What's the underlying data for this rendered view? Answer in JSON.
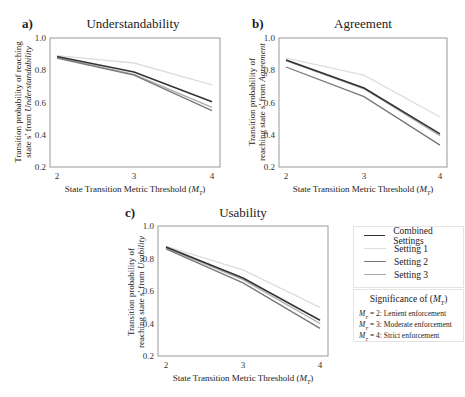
{
  "chart_data": [
    {
      "panel": "a)",
      "type": "line",
      "title": "Understandability",
      "xlabel": "State Transition Metric Threshold (M_T)",
      "ylabel_line1": "Transition probability of reaching",
      "ylabel_line2_prefix": "state s' from ",
      "ylabel_line2_italic": "Understandability",
      "x": [
        2,
        3,
        4
      ],
      "xticks": [
        "2",
        "3",
        "4"
      ],
      "yticks": [
        "1.0",
        "0.8",
        "0.6",
        "0.4",
        "0.2"
      ],
      "ylim": [
        0.2,
        1.0
      ],
      "grid": false,
      "series": [
        {
          "name": "Setting 1",
          "values": [
            0.89,
            0.845,
            0.71
          ]
        },
        {
          "name": "Setting 3",
          "values": [
            0.88,
            0.775,
            0.57
          ]
        },
        {
          "name": "Setting 2",
          "values": [
            0.875,
            0.77,
            0.55
          ]
        },
        {
          "name": "Combined Settings",
          "values": [
            0.885,
            0.79,
            0.605
          ]
        }
      ]
    },
    {
      "panel": "b)",
      "type": "line",
      "title": "Agreement",
      "xlabel": "State Transition Metric Threshold (M_T)",
      "ylabel_line1": "Transition probability of",
      "ylabel_line2_prefix": "reaching state s' from ",
      "ylabel_line2_italic": "Agreement",
      "x": [
        2,
        3,
        4
      ],
      "xticks": [
        "2",
        "3",
        "4"
      ],
      "yticks": [
        "1.0",
        "0.8",
        "0.6",
        "0.4",
        "0.2"
      ],
      "ylim": [
        0.2,
        1.0
      ],
      "grid": false,
      "series": [
        {
          "name": "Setting 1",
          "values": [
            0.875,
            0.77,
            0.51
          ]
        },
        {
          "name": "Setting 3",
          "values": [
            0.86,
            0.685,
            0.395
          ]
        },
        {
          "name": "Setting 2",
          "values": [
            0.82,
            0.636,
            0.336
          ]
        },
        {
          "name": "Combined Settings",
          "values": [
            0.864,
            0.69,
            0.405
          ]
        }
      ]
    },
    {
      "panel": "c)",
      "type": "line",
      "title": "Usability",
      "xlabel": "State Transition Metric Threshold (M_T)",
      "ylabel_line1": "Transition probability of",
      "ylabel_line2_prefix": "reaching state s' from ",
      "ylabel_line2_italic": "Usability",
      "x": [
        2,
        3,
        4
      ],
      "xticks": [
        "2",
        "3",
        "4"
      ],
      "yticks": [
        "1.0",
        "0.8",
        "0.6",
        "0.4",
        "0.2"
      ],
      "ylim": [
        0.2,
        1.0
      ],
      "grid": false,
      "series": [
        {
          "name": "Setting 1",
          "values": [
            0.875,
            0.73,
            0.5
          ]
        },
        {
          "name": "Setting 3",
          "values": [
            0.865,
            0.67,
            0.4
          ]
        },
        {
          "name": "Setting 2",
          "values": [
            0.86,
            0.65,
            0.37
          ]
        },
        {
          "name": "Combined Settings",
          "values": [
            0.87,
            0.68,
            0.42
          ]
        }
      ]
    }
  ],
  "series_colors": {
    "Combined Settings": "#333333",
    "Setting 1": "#dddddd",
    "Setting 2": "#777777",
    "Setting 3": "#aaaaaa"
  },
  "legend": {
    "items": [
      {
        "label": "Combined Settings",
        "color": "#333333"
      },
      {
        "label": "Setting 1",
        "color": "#dddddd"
      },
      {
        "label": "Setting 2",
        "color": "#777777"
      },
      {
        "label": "Setting 3",
        "color": "#aaaaaa"
      }
    ]
  },
  "significance": {
    "title": "Significance of (M_T)",
    "rows": [
      {
        "key": "M_T = 2",
        "text": ": Lenient enforcement"
      },
      {
        "key": "M_T = 3",
        "text": ": Moderate enforcement"
      },
      {
        "key": "M_T = 4",
        "text": ": Strict enforcement"
      }
    ]
  }
}
